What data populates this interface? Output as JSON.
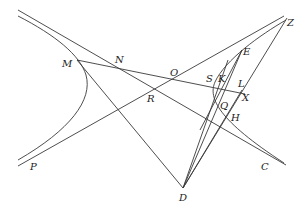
{
  "figure": {
    "type": "geometric-construction",
    "points": [
      {
        "id": "M",
        "label": "M",
        "x": 62,
        "y": 64
      },
      {
        "id": "N",
        "label": "N",
        "x": 116,
        "y": 60
      },
      {
        "id": "O",
        "label": "O",
        "x": 171,
        "y": 74
      },
      {
        "id": "R",
        "label": "R",
        "x": 148,
        "y": 96
      },
      {
        "id": "S",
        "label": "S",
        "x": 207,
        "y": 80
      },
      {
        "id": "K",
        "label": "K",
        "x": 219,
        "y": 80
      },
      {
        "id": "L",
        "label": "L",
        "x": 239,
        "y": 85
      },
      {
        "id": "E",
        "label": "E",
        "x": 243,
        "y": 51
      },
      {
        "id": "Z",
        "label": "Z",
        "x": 287,
        "y": 20
      },
      {
        "id": "X",
        "label": "X",
        "x": 242,
        "y": 99
      },
      {
        "id": "Q",
        "label": "Q",
        "x": 221,
        "y": 107
      },
      {
        "id": "H",
        "label": "H",
        "x": 232,
        "y": 118
      },
      {
        "id": "P",
        "label": "P",
        "x": 31,
        "y": 165
      },
      {
        "id": "C",
        "label": "C",
        "x": 262,
        "y": 164
      },
      {
        "id": "D",
        "label": "D",
        "x": 181,
        "y": 197
      }
    ],
    "stroke_color": "#3a3a3a",
    "label_color": "#222222"
  }
}
